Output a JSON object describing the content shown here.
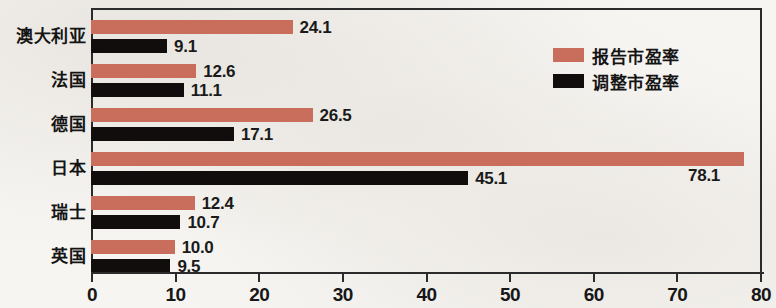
{
  "chart_data": {
    "type": "bar",
    "orientation": "horizontal",
    "title": "",
    "xlabel": "",
    "ylabel": "",
    "xlim": [
      0,
      80
    ],
    "xticks": [
      0,
      10,
      20,
      30,
      40,
      50,
      60,
      70,
      80
    ],
    "grid": false,
    "legend_position": "upper-right-inside",
    "categories": [
      "澳大利亚",
      "法国",
      "德国",
      "日本",
      "瑞士",
      "英国"
    ],
    "series": [
      {
        "name": "报告市盈率",
        "color": "#c96d5c",
        "values": [
          24.1,
          12.6,
          26.5,
          78.1,
          12.4,
          10.0
        ],
        "value_labels": [
          "24.1",
          "12.6",
          "26.5",
          "78.1",
          "12.4",
          "10.0"
        ]
      },
      {
        "name": "调整市盈率",
        "color": "#100d0c",
        "values": [
          9.1,
          11.1,
          17.1,
          45.1,
          10.7,
          9.5
        ],
        "value_labels": [
          "9.1",
          "11.1",
          "17.1",
          "45.1",
          "10.7",
          "9.5"
        ]
      }
    ]
  },
  "legend": {
    "items": [
      {
        "label": "报告市盈率",
        "color": "#c96d5c"
      },
      {
        "label": "调整市盈率",
        "color": "#100d0c"
      }
    ]
  },
  "axis": {
    "tick_labels": [
      "0",
      "10",
      "20",
      "30",
      "40",
      "50",
      "60",
      "70",
      "80"
    ]
  }
}
